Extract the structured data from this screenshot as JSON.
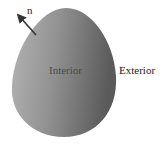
{
  "diagram": {
    "region": {
      "shape": "egg",
      "fill_light": "#b0b0b0",
      "fill_dark": "#5e5e5e"
    },
    "labels": {
      "interior": "Interior",
      "exterior": "Exterior",
      "normal": "n"
    },
    "arrow": {
      "color": "#333333"
    }
  }
}
